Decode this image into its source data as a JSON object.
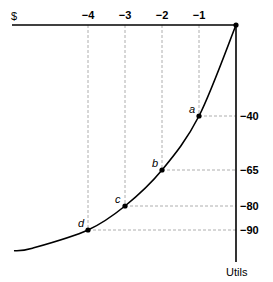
{
  "chart_data": {
    "type": "line",
    "title": "",
    "xlabel": "$",
    "ylabel": "Utils",
    "x_ticks": [
      -4,
      -3,
      -2,
      -1
    ],
    "x_tick_labels": [
      "−4",
      "−3",
      "−2",
      "−1"
    ],
    "y_ticks": [
      -40,
      -65,
      -80,
      -90
    ],
    "y_tick_labels": [
      "−40",
      "−65",
      "−80",
      "−90"
    ],
    "xlim": [
      -6.5,
      0
    ],
    "ylim": [
      -100,
      0
    ],
    "grid": false,
    "points": [
      {
        "label": "a",
        "x": -1,
        "y": -40
      },
      {
        "label": "b",
        "x": -2,
        "y": -65
      },
      {
        "label": "c",
        "x": -3,
        "y": -80
      },
      {
        "label": "d",
        "x": -4,
        "y": -90
      }
    ],
    "curve": [
      {
        "x": 0,
        "y": 0
      },
      {
        "x": -1,
        "y": -40
      },
      {
        "x": -2,
        "y": -65
      },
      {
        "x": -3,
        "y": -80
      },
      {
        "x": -4,
        "y": -90
      },
      {
        "x": -5.5,
        "y": -97
      },
      {
        "x": -6,
        "y": -98
      }
    ]
  }
}
